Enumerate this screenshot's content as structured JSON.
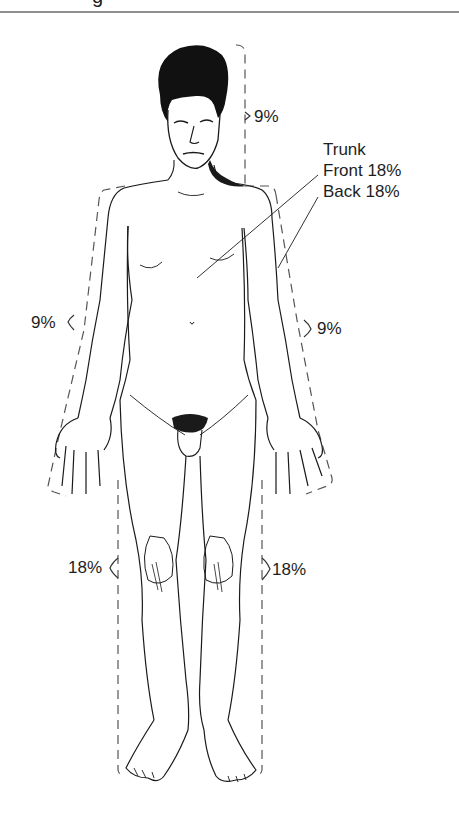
{
  "figure": {
    "title_fragment": "g"
  },
  "regions": {
    "head": {
      "name": "Head",
      "label": "9%"
    },
    "trunk": {
      "title": "Trunk",
      "front": "Front 18%",
      "back": "Back 18%"
    },
    "left_arm": {
      "name": "Left arm",
      "label": "9%"
    },
    "right_arm": {
      "name": "Right arm",
      "label": "9%"
    },
    "left_leg": {
      "name": "Left leg",
      "label": "18%"
    },
    "right_leg": {
      "name": "Right leg",
      "label": "18%"
    }
  },
  "colors": {
    "ink": "#1a1a1a",
    "dash": "#555555",
    "rule": "#8e8e8e",
    "background": "#ffffff"
  }
}
